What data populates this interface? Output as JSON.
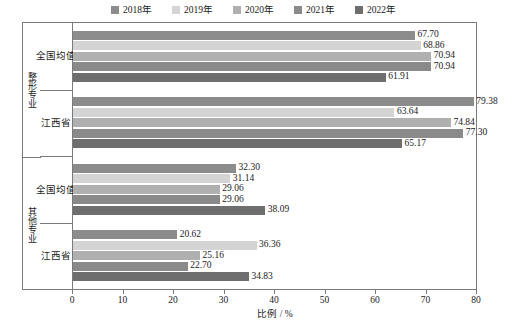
{
  "chart_data": {
    "type": "bar",
    "orientation": "horizontal",
    "title": "",
    "subtitle": "",
    "xlabel": "比例 / %",
    "ylabel": "",
    "xlim": [
      0,
      80
    ],
    "xticks": [
      0,
      10,
      20,
      30,
      40,
      50,
      60,
      70,
      80
    ],
    "xtick_labels": [
      "0",
      "10",
      "20",
      "30",
      "40",
      "50",
      "60",
      "70",
      "80"
    ],
    "grid": false,
    "legend_position": "top-center",
    "legend": [
      "2018年",
      "2019年",
      "2020年",
      "2021年",
      "2022年"
    ],
    "series": [
      {
        "name": "2018年",
        "color": "#8c8c8c",
        "values": [
          67.7,
          79.38,
          32.3,
          20.62
        ]
      },
      {
        "name": "2019年",
        "color": "#d4d4d4",
        "values": [
          68.86,
          63.64,
          31.14,
          36.36
        ]
      },
      {
        "name": "2020年",
        "color": "#b0b0b0",
        "values": [
          70.94,
          74.84,
          29.06,
          25.16
        ]
      },
      {
        "name": "2021年",
        "color": "#8a8a8a",
        "values": [
          70.94,
          77.3,
          29.06,
          22.7
        ]
      },
      {
        "name": "2022年",
        "color": "#6e6e6e",
        "values": [
          61.91,
          65.17,
          38.09,
          34.83
        ]
      }
    ],
    "categories": [
      "全国均值",
      "江西省",
      "全国均值",
      "江西省"
    ],
    "group_labels": [
      "整形专业",
      "其他专业"
    ],
    "groups": [
      {
        "group": "整形专业",
        "rows": [
          {
            "category": "全国均值",
            "bars": [
              {
                "series": "2018年",
                "value": 67.7,
                "label": "67.70"
              },
              {
                "series": "2019年",
                "value": 68.86,
                "label": "68.86"
              },
              {
                "series": "2020年",
                "value": 70.94,
                "label": "70.94"
              },
              {
                "series": "2021年",
                "value": 70.94,
                "label": "70.94"
              },
              {
                "series": "2022年",
                "value": 61.91,
                "label": "61.91"
              }
            ]
          },
          {
            "category": "江西省",
            "bars": [
              {
                "series": "2018年",
                "value": 79.38,
                "label": "79.38"
              },
              {
                "series": "2019年",
                "value": 63.64,
                "label": "63.64"
              },
              {
                "series": "2020年",
                "value": 74.84,
                "label": "74.84"
              },
              {
                "series": "2021年",
                "value": 77.3,
                "label": "77.30"
              },
              {
                "series": "2022年",
                "value": 65.17,
                "label": "65.17"
              }
            ]
          }
        ]
      },
      {
        "group": "其他专业",
        "rows": [
          {
            "category": "全国均值",
            "bars": [
              {
                "series": "2018年",
                "value": 32.3,
                "label": "32.30"
              },
              {
                "series": "2019年",
                "value": 31.14,
                "label": "31.14"
              },
              {
                "series": "2020年",
                "value": 29.06,
                "label": "29.06"
              },
              {
                "series": "2021年",
                "value": 29.06,
                "label": "29.06"
              },
              {
                "series": "2022年",
                "value": 38.09,
                "label": "38.09"
              }
            ]
          },
          {
            "category": "江西省",
            "bars": [
              {
                "series": "2018年",
                "value": 20.62,
                "label": "20.62"
              },
              {
                "series": "2019年",
                "value": 36.36,
                "label": "36.36"
              },
              {
                "series": "2020年",
                "value": 25.16,
                "label": "25.16"
              },
              {
                "series": "2021年",
                "value": 22.7,
                "label": "22.70"
              },
              {
                "series": "2022年",
                "value": 34.83,
                "label": "34.83"
              }
            ]
          }
        ]
      }
    ]
  },
  "colors": {
    "axis": "#7a7a7a",
    "text": "#1a1a1a",
    "background": "#ffffff"
  }
}
